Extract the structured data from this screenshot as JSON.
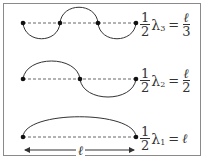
{
  "modes": [
    {
      "label_num": "1",
      "label_den": "2",
      "lambda": "λ",
      "sub": "3",
      "eq": "=",
      "rhs_num": "ℓ",
      "rhs_den": "3"
    },
    {
      "label_num": "1",
      "label_den": "2",
      "lambda": "λ",
      "sub": "2",
      "eq": "=",
      "rhs_num": "ℓ",
      "rhs_den": "2"
    },
    {
      "label_num": "1",
      "label_den": "2",
      "lambda": "λ",
      "sub": "1",
      "eq": "=",
      "rhs": "ℓ"
    }
  ],
  "length_label": "ℓ",
  "colors": {
    "curve": "#333333",
    "dash": "#666666",
    "border": "#8a8a8a"
  }
}
